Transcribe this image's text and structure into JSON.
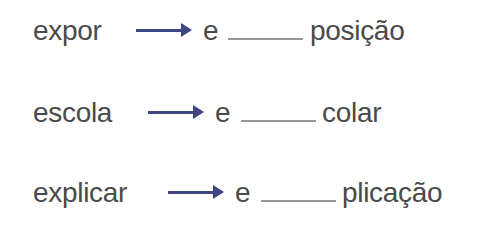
{
  "colors": {
    "text": "#4a4a4a",
    "arrow": "#3f4482",
    "blank_line": "#9a9a9a"
  },
  "exercise": {
    "rows": [
      {
        "source_word": "expor",
        "prefix": "e",
        "blank": "",
        "suffix": "posição"
      },
      {
        "source_word": "escola",
        "prefix": "e",
        "blank": "",
        "suffix": "colar"
      },
      {
        "source_word": "explicar",
        "prefix": "e",
        "blank": "",
        "suffix": "plicação"
      }
    ],
    "arrow_icon": "right-arrow-icon"
  }
}
